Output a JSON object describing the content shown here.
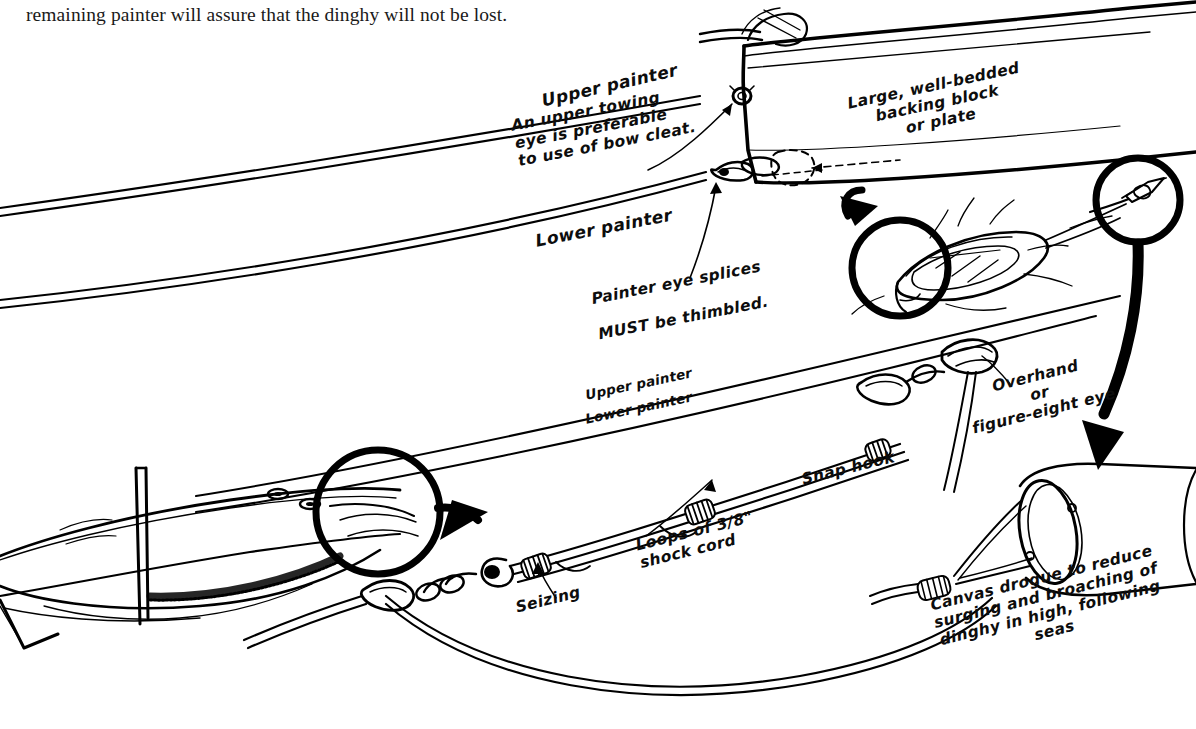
{
  "page": {
    "background_color": "#ffffff",
    "ink_color": "#000000",
    "body_text": "remaining painter will assure that the dinghy will not be lost."
  },
  "diagram": {
    "annotations": [
      {
        "id": "upper-painter-top",
        "text": "Upper painter"
      },
      {
        "id": "upper-towing-eye",
        "text": "An upper towing\neye is preferable\nto use of bow cleat."
      },
      {
        "id": "lower-painter-top",
        "text": "Lower painter"
      },
      {
        "id": "painter-eye-splices-line1",
        "text": "Painter eye splices"
      },
      {
        "id": "painter-eye-splices-must",
        "text": "MUST"
      },
      {
        "id": "painter-eye-splices-line2",
        "text": " be thimbled."
      },
      {
        "id": "backing-block",
        "text": "Large, well-bedded\nbacking block\nor plate"
      },
      {
        "id": "upper-painter-mid",
        "text": "Upper painter"
      },
      {
        "id": "lower-painter-mid",
        "text": "Lower painter"
      },
      {
        "id": "overhand-eye",
        "text": "Overhand\nor\nfigure-eight eye"
      },
      {
        "id": "snap-hook",
        "text": "Snap hook"
      },
      {
        "id": "shock-cord",
        "text": "Loops of 3/8\"\nshock cord"
      },
      {
        "id": "seizing",
        "text": "Seizing"
      },
      {
        "id": "canvas-drogue",
        "text": "Canvas drogue to reduce\nsurging and broaching of\ndinghy in high, following\nseas"
      }
    ],
    "parts": [
      "dinghy-bow",
      "towing-eye",
      "bow-cleat",
      "backing-plate",
      "dinghy-in-water",
      "sailboat-stern",
      "mast",
      "stern-cleats",
      "shock-cord-loops",
      "seizings",
      "snap-hook",
      "shackle",
      "overhand-eye-knot",
      "canvas-drogue",
      "drogue-detail-circle",
      "sailboat-detail-circle",
      "dinghy-detail-circle"
    ]
  }
}
